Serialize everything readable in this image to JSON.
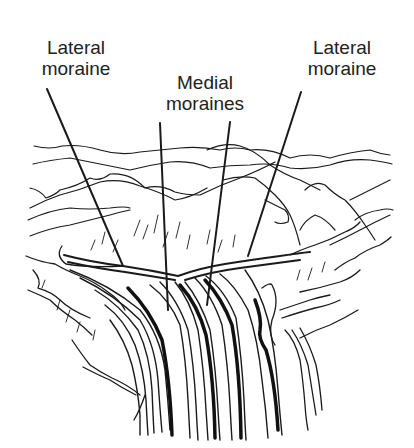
{
  "diagram": {
    "labels": {
      "lateral_left": {
        "line1": "Lateral",
        "line2": "moraine"
      },
      "medial": {
        "line1": "Medial",
        "line2": "moraines"
      },
      "lateral_right": {
        "line1": "Lateral",
        "line2": "moraine"
      }
    },
    "colors": {
      "ink": "#1a1a1a",
      "background": "#ffffff"
    }
  }
}
